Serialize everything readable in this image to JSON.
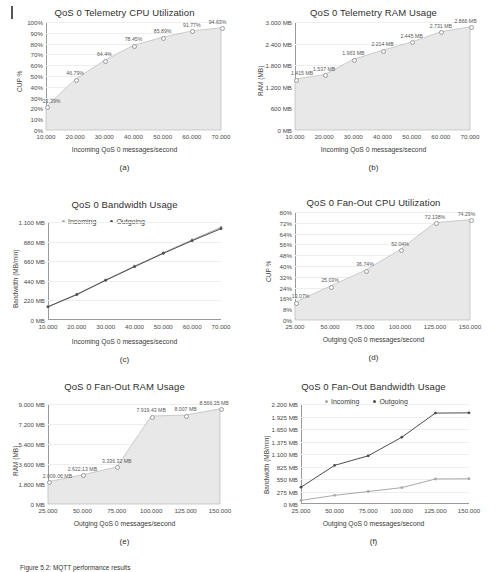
{
  "figure": {
    "margin_mark": "|",
    "caption": "Figure 5.2: MQTT performance results",
    "colors": {
      "area_fill": "#e8e8e8",
      "area_line": "#b9b9b9",
      "axis": "#9a9a9a",
      "grid": "#eeeeee",
      "incoming": "#a9a9a9",
      "outgoing": "#4d4d4d",
      "label_text": "#5a5a5a"
    }
  },
  "chart_data": [
    {
      "id": "a",
      "subcaption": "(a)",
      "type": "area",
      "title": "QoS 0 Telemetry CPU Utilization",
      "xlabel": "Incoming QoS 0 messages/second",
      "ylabel": "CUP %",
      "x": [
        10000,
        20000,
        30000,
        40000,
        50000,
        60000,
        70000
      ],
      "xticklabels": [
        "10.000",
        "20.000",
        "30.000",
        "40.000",
        "50.000",
        "60.000",
        "70.000"
      ],
      "values": [
        21.39,
        46.79,
        64.4,
        78.45,
        85.89,
        91.77,
        94.63
      ],
      "datalabels": [
        "21.39%",
        "46.79%",
        "64.4%",
        "78.45%",
        "85.89%",
        "91.77%",
        "94.63%"
      ],
      "yticklabels": [
        "100%",
        "90%",
        "80%",
        "70%",
        "60%",
        "50%",
        "40%",
        "30%",
        "20%",
        "10%",
        "0%"
      ],
      "ylim": [
        0,
        100
      ],
      "grid": true,
      "legend": null
    },
    {
      "id": "b",
      "subcaption": "(b)",
      "type": "area",
      "title": "QoS 0 Telemetry RAM Usage",
      "xlabel": "Incoming QoS 0 messages/second",
      "ylabel": "RAM (MB)",
      "x": [
        10000,
        20000,
        30000,
        40000,
        50000,
        60000,
        70000
      ],
      "xticklabels": [
        "10.000",
        "20.000",
        "30.000",
        "40.000",
        "50.000",
        "60.000",
        "70.000"
      ],
      "values": [
        1415,
        1537,
        1963,
        2214,
        2445,
        2731,
        2866
      ],
      "datalabels": [
        "1.415 MB",
        "1.537 MB",
        "1.963 MB",
        "2.214 MB",
        "2.445 MB",
        "2.731 MB",
        "2.866 MB"
      ],
      "yticklabels": [
        "3.000 MB",
        "2.400 MB",
        "1.800 MB",
        "1.200 MB",
        "600 MB",
        "0 MB"
      ],
      "ylim": [
        0,
        3000
      ],
      "grid": true,
      "legend": null
    },
    {
      "id": "c",
      "subcaption": "(c)",
      "type": "line",
      "title": "QoS 0 Bandwidth Usage",
      "xlabel": "Incoming QoS 0 messages/second",
      "ylabel": "Bandwidth (MB/min)",
      "x": [
        10000,
        20000,
        30000,
        40000,
        50000,
        60000,
        70000
      ],
      "xticklabels": [
        "10.000",
        "20.000",
        "30.000",
        "40.000",
        "50.000",
        "60.000",
        "70.000"
      ],
      "series": [
        {
          "name": "Incoming",
          "values": [
            150,
            290,
            450,
            605,
            755,
            900,
            1040
          ]
        },
        {
          "name": "Outgoing",
          "values": [
            148,
            285,
            445,
            598,
            748,
            890,
            1025
          ]
        }
      ],
      "yticklabels": [
        "1.100 MB",
        "880 MB",
        "660 MB",
        "440 MB",
        "220 MB",
        "0 MB"
      ],
      "ylim": [
        0,
        1100
      ],
      "grid": true,
      "legend": [
        "Incoming",
        "Outgoing"
      ]
    },
    {
      "id": "d",
      "subcaption": "(d)",
      "type": "area",
      "title": "QoS 0 Fan-Out CPU Utilization",
      "xlabel": "Outging QoS 0 messages/second",
      "ylabel": "CUP %",
      "x": [
        25000,
        50000,
        75000,
        100000,
        125000,
        150000
      ],
      "xticklabels": [
        "25.000",
        "50.000",
        "75.000",
        "100.000",
        "125.000",
        "150.000"
      ],
      "values": [
        13.07,
        25.03,
        36.74,
        52.04,
        72.138,
        74.29
      ],
      "datalabels": [
        "13.07%",
        "25.03%",
        "36.74%",
        "52.04%",
        "72.138%",
        "74.29%"
      ],
      "yticklabels": [
        "80%",
        "72%",
        "64%",
        "56%",
        "48%",
        "40%",
        "32%",
        "24%",
        "16%",
        "8%",
        "0%"
      ],
      "ylim": [
        0,
        80
      ],
      "grid": true,
      "legend": null
    },
    {
      "id": "e",
      "subcaption": "(e)",
      "type": "area",
      "title": "QoS 0 Fan-Out RAM Usage",
      "xlabel": "Outging QoS 0 messages/second",
      "ylabel": "RAM (MB)",
      "x": [
        25000,
        50000,
        75000,
        100000,
        125000,
        150000
      ],
      "xticklabels": [
        "25.000",
        "50.000",
        "75.000",
        "100.000",
        "125.000",
        "150.000"
      ],
      "values": [
        2009.06,
        2622.13,
        3336.32,
        7919.43,
        8007,
        8566.35
      ],
      "datalabels": [
        "2.009.06 MB",
        "2.622.13 MB",
        "3.336.32 MB",
        "7.919.43 MB",
        "8.007 MB",
        "8.566.35 MB"
      ],
      "yticklabels": [
        "9.000 MB",
        "7.200 MB",
        "5.400 MB",
        "3.600 MB",
        "1.800 MB",
        "0 MB"
      ],
      "ylim": [
        0,
        9000
      ],
      "grid": true,
      "legend": null
    },
    {
      "id": "f",
      "subcaption": "(f)",
      "type": "line",
      "title": "QoS 0 Fan-Out Bandwidth Usage",
      "xlabel": "Outging QoS 0 messages/second",
      "ylabel": "Bandwidth (MB/min)",
      "x": [
        25000,
        50000,
        75000,
        100000,
        125000,
        150000
      ],
      "xticklabels": [
        "25.000",
        "50.000",
        "75.000",
        "100.000",
        "125.000",
        "150.000"
      ],
      "series": [
        {
          "name": "Incoming",
          "values": [
            80,
            190,
            275,
            360,
            550,
            555
          ]
        },
        {
          "name": "Outgoing",
          "values": [
            370,
            850,
            1060,
            1470,
            2000,
            2005
          ]
        }
      ],
      "yticklabels": [
        "2.200 MB",
        "1.925 MB",
        "1.650 MB",
        "1.375 MB",
        "1.100 MB",
        "825 MB",
        "550 MB",
        "275 MB",
        "0 MB"
      ],
      "ylim": [
        0,
        2200
      ],
      "grid": true,
      "legend": [
        "Incoming",
        "Outgoing"
      ]
    }
  ]
}
